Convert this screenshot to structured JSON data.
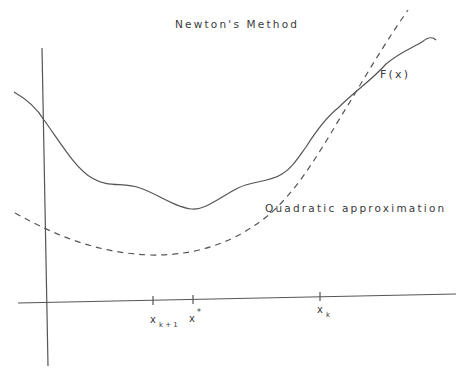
{
  "diagram": {
    "title": "Newton's Method",
    "curves": [
      {
        "name": "F(x)",
        "label": "F(x)",
        "style": "solid"
      },
      {
        "name": "Quadratic approximation",
        "label": "Quadratic approximation",
        "style": "dashed"
      }
    ],
    "axis_ticks": [
      {
        "label": "x",
        "sub": "k+1",
        "sup": ""
      },
      {
        "label": "x",
        "sub": "",
        "sup": "*"
      },
      {
        "label": "x",
        "sub": "k",
        "sup": ""
      }
    ],
    "colors": {
      "line": "#555555",
      "text": "#3a3a3a",
      "background": "#ffffff"
    }
  }
}
